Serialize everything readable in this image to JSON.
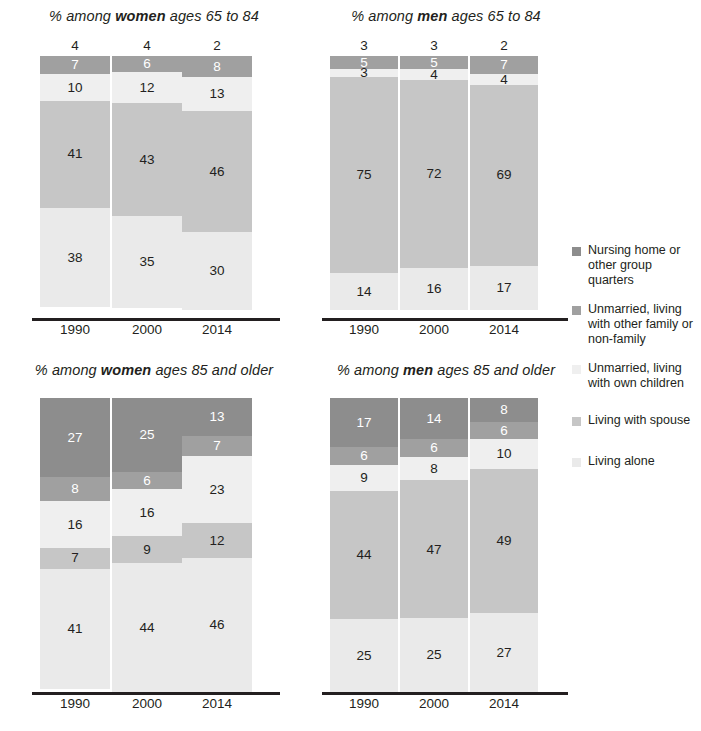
{
  "legend": {
    "position": "right",
    "items": [
      {
        "label": "Nursing home or other group quarters",
        "color": "#8d8d8d",
        "key": "nursing-home"
      },
      {
        "label": "Unmarried, living with other family or non-family",
        "color": "#a0a0a0",
        "key": "unmarried-other-family"
      },
      {
        "label": "Unmarried, living with own children",
        "color": "#efefef",
        "key": "unmarried-own-children"
      },
      {
        "label": "Living with spouse",
        "color": "#c6c6c6",
        "key": "living-with-spouse"
      },
      {
        "label": "Living alone",
        "color": "#eaeaea",
        "key": "living-alone"
      }
    ]
  },
  "categories": [
    "1990",
    "2000",
    "2014"
  ],
  "chart_data": [
    {
      "type": "bar",
      "id": "women-65-84",
      "title": "% among women ages 65 to 84",
      "title_plain": "% among ",
      "title_bold": "women",
      "title_rest": " ages 65 to 84",
      "categories": [
        "1990",
        "2000",
        "2014"
      ],
      "xlabel": "",
      "ylabel": "",
      "ylim": [
        0,
        100
      ],
      "stacked": true,
      "grid": false,
      "series": [
        {
          "name": "Nursing home or other group quarters",
          "values": [
            4,
            4,
            2
          ],
          "color": "#8d8d8d",
          "label_outside": true
        },
        {
          "name": "Unmarried, living with other family or non-family",
          "values": [
            7,
            6,
            8
          ],
          "color": "#a0a0a0"
        },
        {
          "name": "Unmarried, living with own children",
          "values": [
            10,
            12,
            13
          ],
          "color": "#efefef"
        },
        {
          "name": "Living with spouse",
          "values": [
            41,
            43,
            46
          ],
          "color": "#c6c6c6"
        },
        {
          "name": "Living alone",
          "values": [
            38,
            35,
            30
          ],
          "color": "#eaeaea"
        }
      ]
    },
    {
      "type": "bar",
      "id": "men-65-84",
      "title": "% among men ages 65 to 84",
      "title_plain": "% among ",
      "title_bold": "men",
      "title_rest": " ages 65 to 84",
      "categories": [
        "1990",
        "2000",
        "2014"
      ],
      "xlabel": "",
      "ylabel": "",
      "ylim": [
        0,
        100
      ],
      "stacked": true,
      "grid": false,
      "series": [
        {
          "name": "Nursing home or other group quarters",
          "values": [
            3,
            3,
            2
          ],
          "color": "#8d8d8d",
          "label_outside": true
        },
        {
          "name": "Unmarried, living with other family or non-family",
          "values": [
            5,
            5,
            7
          ],
          "color": "#a0a0a0"
        },
        {
          "name": "Unmarried, living with own children",
          "values": [
            3,
            4,
            4
          ],
          "color": "#efefef"
        },
        {
          "name": "Living with spouse",
          "values": [
            75,
            72,
            69
          ],
          "color": "#c6c6c6"
        },
        {
          "name": "Living alone",
          "values": [
            14,
            16,
            17
          ],
          "color": "#eaeaea"
        }
      ]
    },
    {
      "type": "bar",
      "id": "women-85-older",
      "title": "% among women ages 85 and older",
      "title_plain": "% among ",
      "title_bold": "women",
      "title_rest": " ages 85 and older",
      "categories": [
        "1990",
        "2000",
        "2014"
      ],
      "xlabel": "",
      "ylabel": "",
      "ylim": [
        0,
        100
      ],
      "stacked": true,
      "grid": false,
      "series": [
        {
          "name": "Nursing home or other group quarters",
          "values": [
            27,
            25,
            13
          ],
          "color": "#8d8d8d",
          "label_outside": false
        },
        {
          "name": "Unmarried, living with other family or non-family",
          "values": [
            8,
            6,
            7
          ],
          "color": "#a0a0a0"
        },
        {
          "name": "Unmarried, living with own children",
          "values": [
            16,
            16,
            23
          ],
          "color": "#efefef"
        },
        {
          "name": "Living with spouse",
          "values": [
            7,
            9,
            12
          ],
          "color": "#c6c6c6"
        },
        {
          "name": "Living alone",
          "values": [
            41,
            44,
            46
          ],
          "color": "#eaeaea"
        }
      ]
    },
    {
      "type": "bar",
      "id": "men-85-older",
      "title": "% among men ages 85 and older",
      "title_plain": "% among ",
      "title_bold": "men",
      "title_rest": " ages 85 and older",
      "categories": [
        "1990",
        "2000",
        "2014"
      ],
      "xlabel": "",
      "ylabel": "",
      "ylim": [
        0,
        100
      ],
      "stacked": true,
      "grid": false,
      "series": [
        {
          "name": "Nursing home or other group quarters",
          "values": [
            17,
            14,
            8
          ],
          "color": "#8d8d8d",
          "label_outside": false
        },
        {
          "name": "Unmarried, living with other family or non-family",
          "values": [
            6,
            6,
            6
          ],
          "color": "#a0a0a0"
        },
        {
          "name": "Unmarried, living with own children",
          "values": [
            9,
            8,
            10
          ],
          "color": "#efefef"
        },
        {
          "name": "Living with spouse",
          "values": [
            44,
            47,
            49
          ],
          "color": "#c6c6c6"
        },
        {
          "name": "Living alone",
          "values": [
            25,
            25,
            27
          ],
          "color": "#eaeaea"
        }
      ]
    }
  ]
}
